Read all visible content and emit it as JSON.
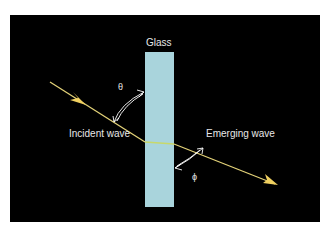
{
  "diagram": {
    "glass_label": "Glass",
    "incident_label": "Incident wave",
    "emerging_label": "Emerging wave",
    "theta_symbol": "θ",
    "phi_symbol": "ϕ",
    "colors": {
      "background": "#000000",
      "glass": "#a9d4dc",
      "ray": "#e3d278",
      "ray_inside": "#c8d86a",
      "arrow": "#f0d060",
      "text": "#e8e8e8",
      "angle_arc": "#ffffff"
    }
  }
}
